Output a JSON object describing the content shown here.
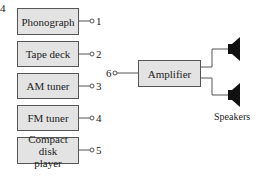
{
  "figure_label": "4",
  "sources": [
    {
      "label": "Phonograph",
      "terminal": "1"
    },
    {
      "label": "Tape deck",
      "terminal": "2"
    },
    {
      "label": "AM tuner",
      "terminal": "3"
    },
    {
      "label": "FM tuner",
      "terminal": "4"
    },
    {
      "label": "Compact disk player",
      "terminal": "5"
    }
  ],
  "amplifier": {
    "label": "Amplifier",
    "input_terminal": "6"
  },
  "speakers": {
    "label": "Speakers",
    "count": 2
  },
  "colors": {
    "box_fill": "#e3e3e3",
    "box_border": "#555555",
    "line": "#555555",
    "speaker": "#111111"
  }
}
